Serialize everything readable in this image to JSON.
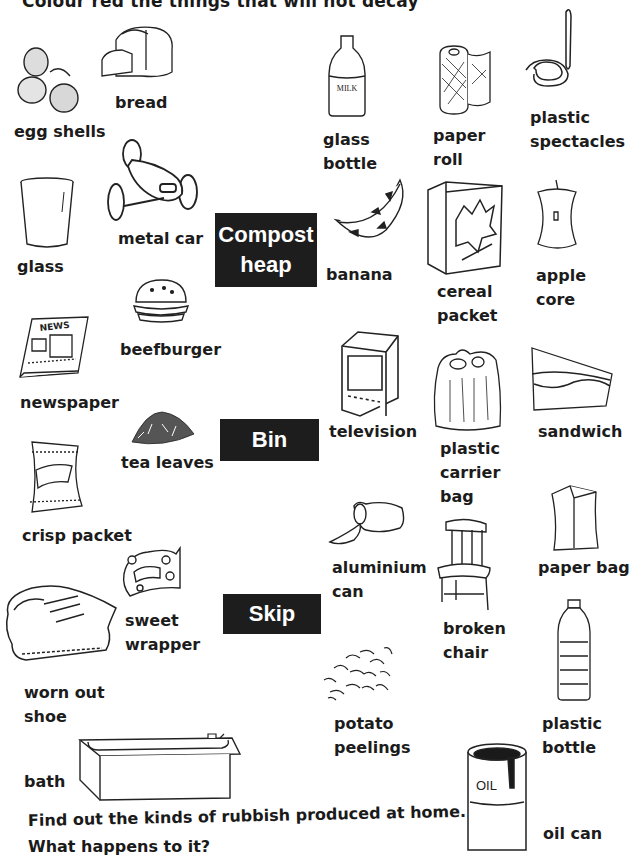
{
  "page": {
    "title": "Colour red the things that will not decay",
    "footer": {
      "line1": "Find out the kinds of rubbish produced at home.",
      "line2": "What happens to it?"
    }
  },
  "destinations": [
    {
      "id": "compost",
      "lines": [
        "Compost",
        "heap"
      ]
    },
    {
      "id": "bin",
      "lines": [
        "Bin"
      ]
    },
    {
      "id": "skip",
      "lines": [
        "Skip"
      ]
    }
  ],
  "items": {
    "egg_shells": [
      "egg shells"
    ],
    "bread": [
      "bread"
    ],
    "glass_bottle": [
      "glass",
      "bottle"
    ],
    "paper_roll": [
      "paper",
      "roll"
    ],
    "plastic_spectacles": [
      "plastic",
      "spectacles"
    ],
    "glass": [
      "glass"
    ],
    "metal_car": [
      "metal car"
    ],
    "banana": [
      "banana"
    ],
    "cereal_packet": [
      "cereal",
      "packet"
    ],
    "apple_core": [
      "apple",
      "core"
    ],
    "beefburger": [
      "beefburger"
    ],
    "newspaper": [
      "newspaper"
    ],
    "television": [
      "television"
    ],
    "plastic_carrier_bag": [
      "plastic",
      "carrier",
      "bag"
    ],
    "sandwich": [
      "sandwich"
    ],
    "tea_leaves": [
      "tea leaves"
    ],
    "crisp_packet": [
      "crisp packet"
    ],
    "aluminium_can": [
      "aluminium",
      "can"
    ],
    "paper_bag": [
      "paper bag"
    ],
    "sweet_wrapper": [
      "sweet",
      "wrapper"
    ],
    "broken_chair": [
      "broken",
      "chair"
    ],
    "worn_out_shoe": [
      "worn out",
      "shoe"
    ],
    "potato_peelings": [
      "potato",
      "peelings"
    ],
    "plastic_bottle": [
      "plastic",
      "bottle"
    ],
    "bath": [
      "bath"
    ],
    "oil_can": [
      "oil can"
    ]
  },
  "illustration_text": {
    "milk_label": "MILK",
    "news_label": "NEWS",
    "oil_label": "OIL"
  },
  "colors": {
    "box_bg": "#1d1d1d",
    "box_text": "#ffffff",
    "ink": "#1c1c1c",
    "paper": "#ffffff"
  }
}
